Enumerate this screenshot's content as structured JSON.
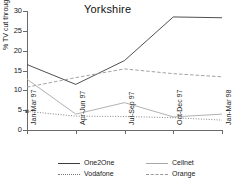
{
  "chart_data": {
    "type": "line",
    "title": "Yorkshire",
    "xlabel": "",
    "ylabel": "% TV cut through",
    "categories": [
      "Jan-Mar 97",
      "Apr-Jun 97",
      "Jul-Sep 97",
      "Oct-Dec 97",
      "Jan-Mar 98"
    ],
    "ylim": [
      0,
      30
    ],
    "yticks": [
      0,
      5,
      10,
      15,
      20,
      25,
      30
    ],
    "grid": false,
    "legend_position": "bottom",
    "series": [
      {
        "name": "One2One",
        "values": [
          16.5,
          11.5,
          17.5,
          28.5,
          28.3
        ],
        "style": "solid",
        "color": "#3c3c3c"
      },
      {
        "name": "Vodafone",
        "values": [
          4.7,
          3.5,
          3.4,
          3.1,
          2.5
        ],
        "style": "dotted",
        "color": "#777777"
      },
      {
        "name": "Cellnet",
        "values": [
          12.8,
          4.0,
          6.9,
          3.3,
          4.0
        ],
        "style": "solid",
        "color": "#a8a8a8"
      },
      {
        "name": "Orange",
        "values": [
          10.8,
          13.2,
          15.4,
          14.2,
          13.4
        ],
        "style": "dashed",
        "color": "#999999"
      }
    ]
  },
  "legend": {
    "items": [
      {
        "label": "One2One"
      },
      {
        "label": "Cellnet"
      },
      {
        "label": "Vodafone"
      },
      {
        "label": "Orange"
      }
    ]
  }
}
